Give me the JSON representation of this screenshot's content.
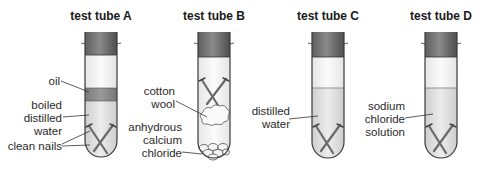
{
  "figure": {
    "tubes": [
      {
        "id": "A",
        "title": "test tube A",
        "labels": {
          "oil": "oil",
          "water_line1": "boiled",
          "water_line2": "distilled",
          "water_line3": "water",
          "nails": "clean nails"
        }
      },
      {
        "id": "B",
        "title": "test tube B",
        "labels": {
          "cotton_line1": "cotton",
          "cotton_line2": "wool",
          "chem_line1": "anhydrous",
          "chem_line2": "calcium",
          "chem_line3": "chloride"
        }
      },
      {
        "id": "C",
        "title": "test tube C",
        "labels": {
          "water_line1": "distilled",
          "water_line2": "water"
        }
      },
      {
        "id": "D",
        "title": "test tube D",
        "labels": {
          "sol_line1": "sodium",
          "sol_line2": "chloride",
          "sol_line3": "solution"
        }
      }
    ],
    "colors": {
      "stopper": "#6f6f6f",
      "oil": "#8c8c8c",
      "liquid": "#dcdcdc",
      "air": "#f2f2f2",
      "outline": "#3a3a3a",
      "nail": "#707070"
    }
  }
}
